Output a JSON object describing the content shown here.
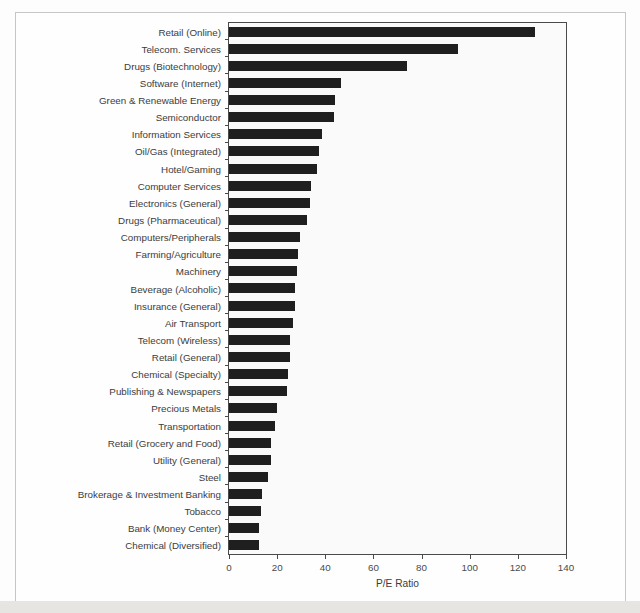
{
  "chart_data": {
    "type": "bar",
    "orientation": "horizontal",
    "title": "",
    "xlabel": "P/E Ratio",
    "ylabel": "",
    "xlim": [
      0,
      140
    ],
    "x_ticks": [
      0,
      20,
      40,
      60,
      80,
      100,
      120,
      140
    ],
    "grid": false,
    "legend": "none",
    "bar_color": "#1f1f1f",
    "plot_background": "#fbfafa",
    "axis_color": "#4a4a4a",
    "categories": [
      "Retail (Online)",
      "Telecom. Services",
      "Drugs (Biotechnology)",
      "Software (Internet)",
      "Green & Renewable Energy",
      "Semiconductor",
      "Information Services",
      "Oil/Gas (Integrated)",
      "Hotel/Gaming",
      "Computer Services",
      "Electronics (General)",
      "Drugs (Pharmaceutical)",
      "Computers/Peripherals",
      "Farming/Agriculture",
      "Machinery",
      "Beverage (Alcoholic)",
      "Insurance (General)",
      "Air Transport",
      "Telecom (Wireless)",
      "Retail (General)",
      "Chemical (Specialty)",
      "Publishing & Newspapers",
      "Precious Metals",
      "Transportation",
      "Retail (Grocery and Food)",
      "Utility (General)",
      "Steel",
      "Brokerage & Investment Banking",
      "Tobacco",
      "Bank (Money Center)",
      "Chemical (Diversified)"
    ],
    "values": [
      127,
      95,
      74,
      46.5,
      44,
      43.5,
      38.6,
      37.3,
      36.6,
      34.2,
      33.8,
      32.2,
      29.5,
      28.5,
      28.2,
      27.5,
      27.3,
      26.6,
      25.4,
      25.2,
      24.5,
      24.3,
      20,
      19.2,
      17.6,
      17.4,
      16.3,
      13.7,
      13.3,
      12.6,
      12.4
    ]
  }
}
